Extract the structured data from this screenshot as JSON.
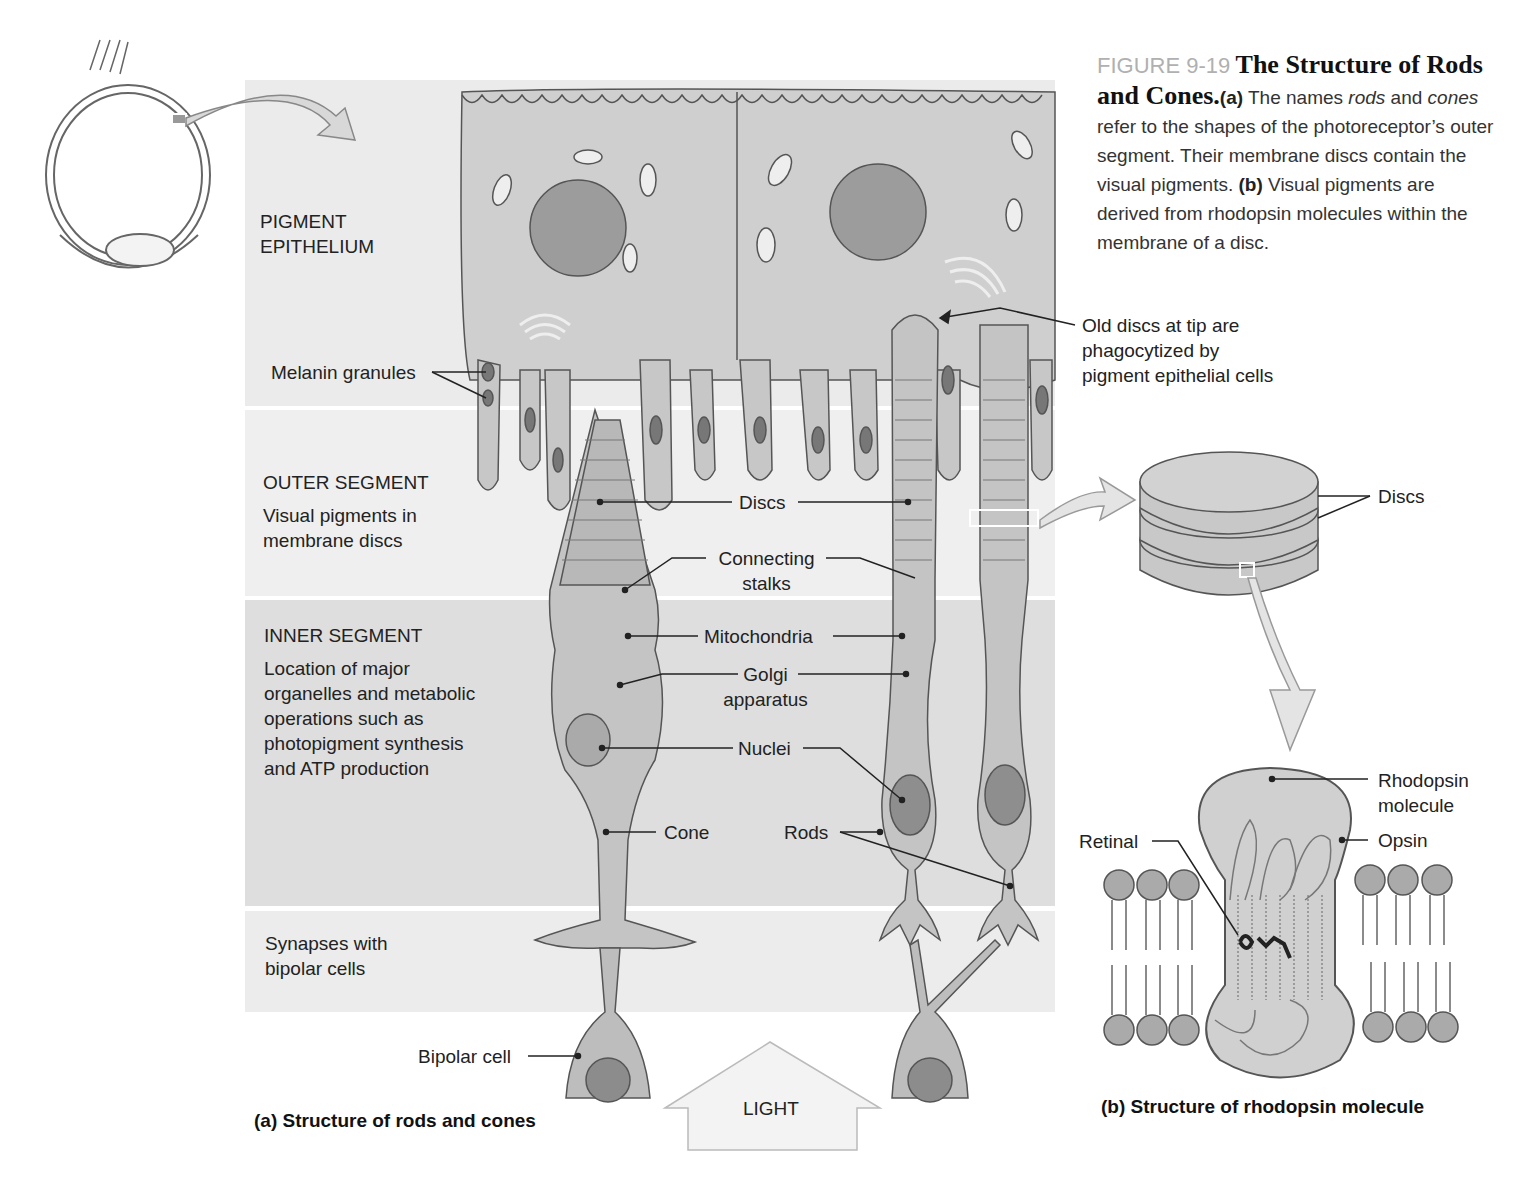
{
  "caption": {
    "figure_number": "FIGURE 9-19",
    "title": "The Structure of Rods and Cones.",
    "part_a_marker": "(a)",
    "part_a_text_1": " The names ",
    "rods_italic": "rods",
    "part_a_text_2": " and ",
    "cones_italic": "cones",
    "part_a_text_3": " refer to the shapes of the photoreceptor’s outer segment. Their membrane discs contain the visual pigments. ",
    "part_b_marker": "(b)",
    "part_b_text": " Visual pigments are derived from rhodopsin molecules within the membrane of a disc."
  },
  "panel_a": {
    "subtitle": "(a) Structure of rods and cones",
    "layers": {
      "pigment_epithelium": "PIGMENT\nEPITHELIUM",
      "outer_segment_title": "OUTER SEGMENT",
      "outer_segment_desc": "Visual pigments in\nmembrane discs",
      "inner_segment_title": "INNER SEGMENT",
      "inner_segment_desc": "Location of major\norganelles and metabolic\noperations such as\nphotopigment synthesis\nand ATP production",
      "synapses": "Synapses with\nbipolar cells"
    },
    "labels": {
      "melanin_granules": "Melanin granules",
      "discs": "Discs",
      "connecting_stalks": "Connecting\nstalks",
      "mitochondria": "Mitochondria",
      "golgi": "Golgi\napparatus",
      "nuclei": "Nuclei",
      "cone": "Cone",
      "rods": "Rods",
      "bipolar_cell": "Bipolar cell",
      "light": "LIGHT",
      "old_discs": "Old discs at tip are\nphagocytized by\npigment epithelial cells"
    }
  },
  "panel_b": {
    "subtitle": "(b) Structure of rhodopsin molecule",
    "labels": {
      "discs": "Discs",
      "rhodopsin_molecule": "Rhodopsin\nmolecule",
      "opsin": "Opsin",
      "retinal": "Retinal"
    }
  },
  "colors": {
    "band_light": "#ededed",
    "band_dark": "#dcdcdc",
    "cell_fill": "#c9c9c9",
    "cell_stroke": "#555555",
    "nucleus_fill": "#9a9a9a"
  }
}
